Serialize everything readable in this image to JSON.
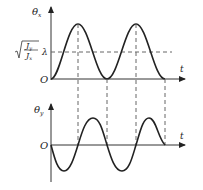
{
  "diagram": {
    "top_plot": {
      "y_axis_label": "θ",
      "y_axis_subscript": "x",
      "x_axis_label": "t",
      "origin_label": "O",
      "level_label": "λ",
      "level_expr_num": "J",
      "level_expr_num_sub": "y",
      "level_expr_den": "J",
      "level_expr_den_sub": "x"
    },
    "bottom_plot": {
      "y_axis_label": "θ",
      "y_axis_subscript": "y",
      "x_axis_label": "t",
      "origin_label": "O"
    },
    "colors": {
      "curve": "#222222",
      "axis": "#333333",
      "dashed": "#666666"
    }
  }
}
